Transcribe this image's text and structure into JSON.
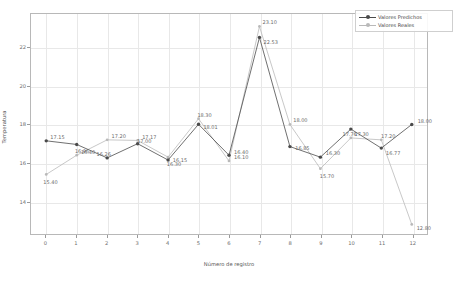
{
  "chart_data": {
    "type": "line",
    "title": "",
    "xlabel": "Número de registro",
    "ylabel": "Temperatura",
    "x": [
      0,
      1,
      2,
      3,
      4,
      5,
      6,
      7,
      8,
      9,
      10,
      11,
      12
    ],
    "xtick_labels": [
      "0",
      "1",
      "2",
      "3",
      "4",
      "5",
      "6",
      "7",
      "8",
      "9",
      "10",
      "11",
      "12"
    ],
    "ytick_labels": [
      "14",
      "16",
      "18",
      "20",
      "22"
    ],
    "yticks": [
      14,
      16,
      18,
      20,
      22
    ],
    "xlim": [
      -0.5,
      12.5
    ],
    "ylim": [
      12.3,
      23.75
    ],
    "grid": true,
    "legend_position": "upper right",
    "series": [
      {
        "name": "Valores Predichos",
        "color": "#4a4a4a",
        "marker": "circle",
        "values": [
          17.15,
          16.96,
          16.26,
          17.0,
          16.15,
          18.01,
          16.4,
          22.53,
          16.85,
          16.3,
          17.76,
          16.77,
          18.0
        ],
        "labels": [
          "17.15",
          "16.96",
          "16.26",
          "17.00",
          "16.15",
          "18.01",
          "16.40",
          "22.53",
          "16.85",
          "16.30",
          "17.76",
          "16.77",
          "18.00"
        ]
      },
      {
        "name": "Valores Reales",
        "color": "#b9b9b9",
        "marker": "circle",
        "values": [
          15.4,
          16.4,
          17.2,
          17.17,
          16.3,
          18.3,
          16.1,
          23.1,
          18.0,
          15.7,
          17.3,
          17.2,
          12.8
        ],
        "labels": [
          "15.40",
          "16.40",
          "17.20",
          "17.17",
          "16.30",
          "18.30",
          "16.10",
          "23.10",
          "18.00",
          "15.70",
          "17.30",
          "17.20",
          "12.80"
        ]
      }
    ],
    "point_label_offsets": {
      "predicted": [
        {
          "dx": 4,
          "dy": -5
        },
        {
          "dx": -2,
          "dy": 5
        },
        {
          "dx": -11,
          "dy": -5
        },
        {
          "dx": -1,
          "dy": -4
        },
        {
          "dx": 4,
          "dy": -1
        },
        {
          "dx": 4,
          "dy": 2
        },
        {
          "dx": 4,
          "dy": -5
        },
        {
          "dx": 3,
          "dy": 4
        },
        {
          "dx": 4,
          "dy": 0
        },
        {
          "dx": 4,
          "dy": -5
        },
        {
          "dx": -10,
          "dy": 4
        },
        {
          "dx": 3,
          "dy": 4
        },
        {
          "dx": 4,
          "dy": -4
        }
      ],
      "real": [
        {
          "dx": -3,
          "dy": 6
        },
        {
          "dx": 4,
          "dy": -5
        },
        {
          "dx": 4,
          "dy": -5
        },
        {
          "dx": 4,
          "dy": -5
        },
        {
          "dx": -2,
          "dy": 6
        },
        {
          "dx": -2,
          "dy": -5
        },
        {
          "dx": 4,
          "dy": -5
        },
        {
          "dx": 2,
          "dy": -5
        },
        {
          "dx": 2,
          "dy": -5
        },
        {
          "dx": -2,
          "dy": 6
        },
        {
          "dx": 2,
          "dy": -5
        },
        {
          "dx": -2,
          "dy": -5
        },
        {
          "dx": 3,
          "dy": 2
        }
      ]
    }
  }
}
